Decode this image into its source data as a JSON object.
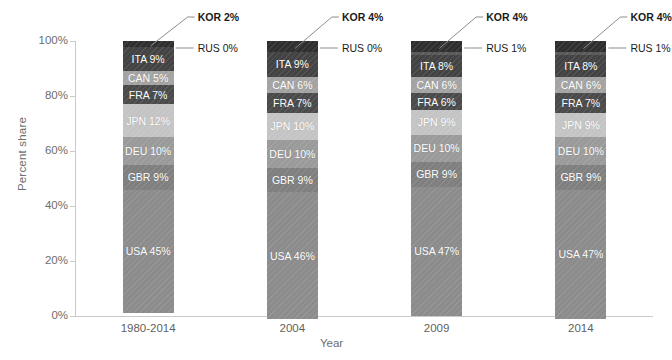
{
  "chart_data": {
    "type": "bar",
    "subtype": "stacked-100-percent",
    "title": "",
    "xlabel": "Year",
    "ylabel": "Percent share",
    "ylim": [
      0,
      100
    ],
    "yticks": [
      "0%",
      "20%",
      "40%",
      "60%",
      "80%",
      "100%"
    ],
    "ytick_values": [
      0,
      20,
      40,
      60,
      80,
      100
    ],
    "grid": false,
    "legend": "none",
    "categories": [
      "1980-2014",
      "2004",
      "2009",
      "2014"
    ],
    "stack_order_bottom_to_top": [
      "USA",
      "GBR",
      "DEU",
      "JPN",
      "FRA",
      "CAN",
      "ITA",
      "RUS",
      "KOR"
    ],
    "series": [
      {
        "name": "USA",
        "values": [
          45,
          46,
          47,
          47
        ],
        "color": "#8c8c8c",
        "label_inside": true
      },
      {
        "name": "GBR",
        "values": [
          9,
          9,
          9,
          9
        ],
        "color": "#7f7f7f",
        "label_inside": true
      },
      {
        "name": "DEU",
        "values": [
          10,
          10,
          10,
          10
        ],
        "color": "#9a9a9a",
        "label_inside": true
      },
      {
        "name": "JPN",
        "values": [
          12,
          10,
          9,
          9
        ],
        "color": "#c4c4c4",
        "label_inside": true
      },
      {
        "name": "FRA",
        "values": [
          7,
          7,
          6,
          7
        ],
        "color": "#4a4a4a",
        "label_inside": true
      },
      {
        "name": "CAN",
        "values": [
          5,
          6,
          6,
          6
        ],
        "color": "#a3a3a3",
        "label_inside": true
      },
      {
        "name": "ITA",
        "values": [
          9,
          9,
          8,
          8
        ],
        "color": "#434343",
        "label_inside": true
      },
      {
        "name": "RUS",
        "values": [
          0,
          0,
          1,
          1
        ],
        "color": "#595959",
        "label_inside": false
      },
      {
        "name": "KOR",
        "values": [
          2,
          4,
          4,
          4
        ],
        "color": "#2e2e2e",
        "label_inside": false
      }
    ],
    "bar_segment_labels": [
      [
        "USA 45%",
        "GBR 9%",
        "DEU 10%",
        "JPN 12%",
        "FRA 7%",
        "CAN 5%",
        "ITA 9%"
      ],
      [
        "USA 46%",
        "GBR 9%",
        "DEU 10%",
        "JPN 10%",
        "FRA 7%",
        "CAN 6%",
        "ITA 9%"
      ],
      [
        "USA 47%",
        "GBR 9%",
        "DEU 10%",
        "JPN 9%",
        "FRA 6%",
        "CAN 6%",
        "ITA 8%"
      ],
      [
        "USA 47%",
        "GBR 9%",
        "DEU 10%",
        "JPN 9%",
        "FRA 7%",
        "CAN 6%",
        "ITA 8%"
      ]
    ],
    "callouts": [
      {
        "kor": "KOR 2%",
        "rus": "RUS 0%"
      },
      {
        "kor": "KOR 4%",
        "rus": "RUS 0%"
      },
      {
        "kor": "KOR 4%",
        "rus": "RUS 1%"
      },
      {
        "kor": "KOR 4%",
        "rus": "RUS 1%"
      }
    ],
    "colors": {
      "axis": "#c9c9c9",
      "tick_text": "#6e6e6e",
      "category_text": "#5f5f5f",
      "callout_text": "#1a1a1a",
      "leader_line": "#8d8d8d",
      "segment_text": "#ffffff",
      "background": "#ffffff"
    }
  },
  "axes": {
    "y_title": "Percent share",
    "x_title": "Year",
    "y_ticks": [
      {
        "label": "100%",
        "value": 100
      },
      {
        "label": "80%",
        "value": 80
      },
      {
        "label": "60%",
        "value": 60
      },
      {
        "label": "40%",
        "value": 40
      },
      {
        "label": "20%",
        "value": 20
      },
      {
        "label": "0%",
        "value": 0
      }
    ]
  },
  "bars": [
    {
      "category": "1980-2014",
      "segments": [
        {
          "name": "ITA",
          "label": "ITA 9%",
          "value": 9
        },
        {
          "name": "CAN",
          "label": "CAN 5%",
          "value": 5
        },
        {
          "name": "FRA",
          "label": "FRA 7%",
          "value": 7
        },
        {
          "name": "JPN",
          "label": "JPN 12%",
          "value": 12
        },
        {
          "name": "DEU",
          "label": "DEU 10%",
          "value": 10
        },
        {
          "name": "GBR",
          "label": "GBR 9%",
          "value": 9
        },
        {
          "name": "USA",
          "label": "USA 45%",
          "value": 45
        }
      ],
      "kor_label": "KOR 2%",
      "rus_label": "RUS 0%"
    },
    {
      "category": "2004",
      "segments": [
        {
          "name": "ITA",
          "label": "ITA 9%",
          "value": 9
        },
        {
          "name": "CAN",
          "label": "CAN 6%",
          "value": 6
        },
        {
          "name": "FRA",
          "label": "FRA 7%",
          "value": 7
        },
        {
          "name": "JPN",
          "label": "JPN 10%",
          "value": 10
        },
        {
          "name": "DEU",
          "label": "DEU 10%",
          "value": 10
        },
        {
          "name": "GBR",
          "label": "GBR 9%",
          "value": 9
        },
        {
          "name": "USA",
          "label": "USA 46%",
          "value": 46
        }
      ],
      "kor_label": "KOR 4%",
      "rus_label": "RUS 0%"
    },
    {
      "category": "2009",
      "segments": [
        {
          "name": "ITA",
          "label": "ITA 8%",
          "value": 8
        },
        {
          "name": "CAN",
          "label": "CAN 6%",
          "value": 6
        },
        {
          "name": "FRA",
          "label": "FRA 6%",
          "value": 6
        },
        {
          "name": "JPN",
          "label": "JPN 9%",
          "value": 9
        },
        {
          "name": "DEU",
          "label": "DEU 10%",
          "value": 10
        },
        {
          "name": "GBR",
          "label": "GBR 9%",
          "value": 9
        },
        {
          "name": "USA",
          "label": "USA 47%",
          "value": 47
        }
      ],
      "kor_label": "KOR 4%",
      "rus_label": "RUS 1%"
    },
    {
      "category": "2014",
      "segments": [
        {
          "name": "ITA",
          "label": "ITA 8%",
          "value": 8
        },
        {
          "name": "CAN",
          "label": "CAN 6%",
          "value": 6
        },
        {
          "name": "FRA",
          "label": "FRA 7%",
          "value": 7
        },
        {
          "name": "JPN",
          "label": "JPN 9%",
          "value": 9
        },
        {
          "name": "DEU",
          "label": "DEU 10%",
          "value": 10
        },
        {
          "name": "GBR",
          "label": "GBR 9%",
          "value": 9
        },
        {
          "name": "USA",
          "label": "USA 47%",
          "value": 47
        }
      ],
      "kor_label": "KOR 4%",
      "rus_label": "RUS 1%"
    }
  ]
}
